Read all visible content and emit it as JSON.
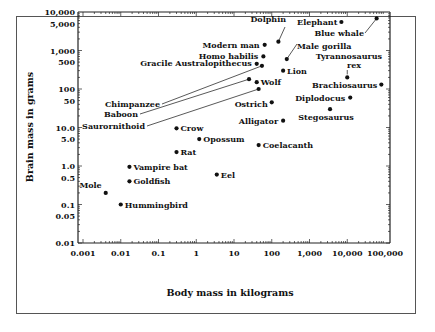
{
  "chart_data": {
    "type": "scatter",
    "title": "",
    "xlabel": "Body mass in kilograms",
    "ylabel": "Brain mass in grams",
    "xscale": "log",
    "yscale": "log",
    "xlim": [
      0.001,
      100000
    ],
    "ylim": [
      0.01,
      10000
    ],
    "x_ticks": [
      "0.001",
      "0.01",
      "0.1",
      "1",
      "10",
      "100",
      "1,000",
      "10,000",
      "100,000"
    ],
    "y_ticks": [
      "10,000",
      "5,000",
      "1,000",
      "500",
      "100",
      "50",
      "10.0",
      "5.0",
      "1.0",
      "0.5",
      "0.1",
      "0.05",
      "0.01"
    ],
    "grid": false,
    "legend": null,
    "points": [
      {
        "label": "Mole",
        "x": 0.004,
        "y": 0.2
      },
      {
        "label": "Hummingbird",
        "x": 0.01,
        "y": 0.1
      },
      {
        "label": "Goldfish",
        "x": 0.017,
        "y": 0.4
      },
      {
        "label": "Vampire bat",
        "x": 0.017,
        "y": 0.95
      },
      {
        "label": "Rat",
        "x": 0.3,
        "y": 2.3
      },
      {
        "label": "Crow",
        "x": 0.3,
        "y": 9.5
      },
      {
        "label": "Opossum",
        "x": 1.2,
        "y": 5.0
      },
      {
        "label": "Eel",
        "x": 3.5,
        "y": 0.6
      },
      {
        "label": "Coelacanth",
        "x": 45,
        "y": 3.5
      },
      {
        "label": "Alligator",
        "x": 200,
        "y": 15
      },
      {
        "label": "Ostrich",
        "x": 100,
        "y": 45
      },
      {
        "label": "Saurornithoid",
        "x": 45,
        "y": 100
      },
      {
        "label": "Baboon",
        "x": 25,
        "y": 180
      },
      {
        "label": "Wolf",
        "x": 40,
        "y": 150
      },
      {
        "label": "Chimpanzee",
        "x": 55,
        "y": 400
      },
      {
        "label": "Gracile Australopithecus",
        "x": 40,
        "y": 450
      },
      {
        "label": "Homo habilis",
        "x": 60,
        "y": 700
      },
      {
        "label": "Modern man",
        "x": 65,
        "y": 1400
      },
      {
        "label": "Dolphin",
        "x": 150,
        "y": 1700
      },
      {
        "label": "Lion",
        "x": 200,
        "y": 300
      },
      {
        "label": "Male gorilla",
        "x": 250,
        "y": 600
      },
      {
        "label": "Elephant",
        "x": 7000,
        "y": 5500
      },
      {
        "label": "Blue whale",
        "x": 60000,
        "y": 6800
      },
      {
        "label": "Tyrannosaurus rex",
        "x": 10000,
        "y": 200
      },
      {
        "label": "Brachiosaurus",
        "x": 80000,
        "y": 130
      },
      {
        "label": "Diplodocus",
        "x": 12000,
        "y": 60
      },
      {
        "label": "Stegosaurus",
        "x": 3500,
        "y": 30
      }
    ]
  }
}
